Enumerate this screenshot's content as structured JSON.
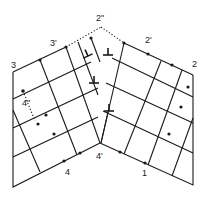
{
  "diagram": {
    "labels": {
      "p3": "3",
      "p3prime": "3'",
      "p2dprime": "2\"",
      "p2prime": "2'",
      "p2": "2",
      "p4dprime": "4\"",
      "p4": "4",
      "p4prime": "4'",
      "p1": "1"
    },
    "dislocation_symbol": "⊥",
    "dislocation_count": 4,
    "colors": {
      "line": "#1a1a1a",
      "background": "#ffffff"
    }
  }
}
